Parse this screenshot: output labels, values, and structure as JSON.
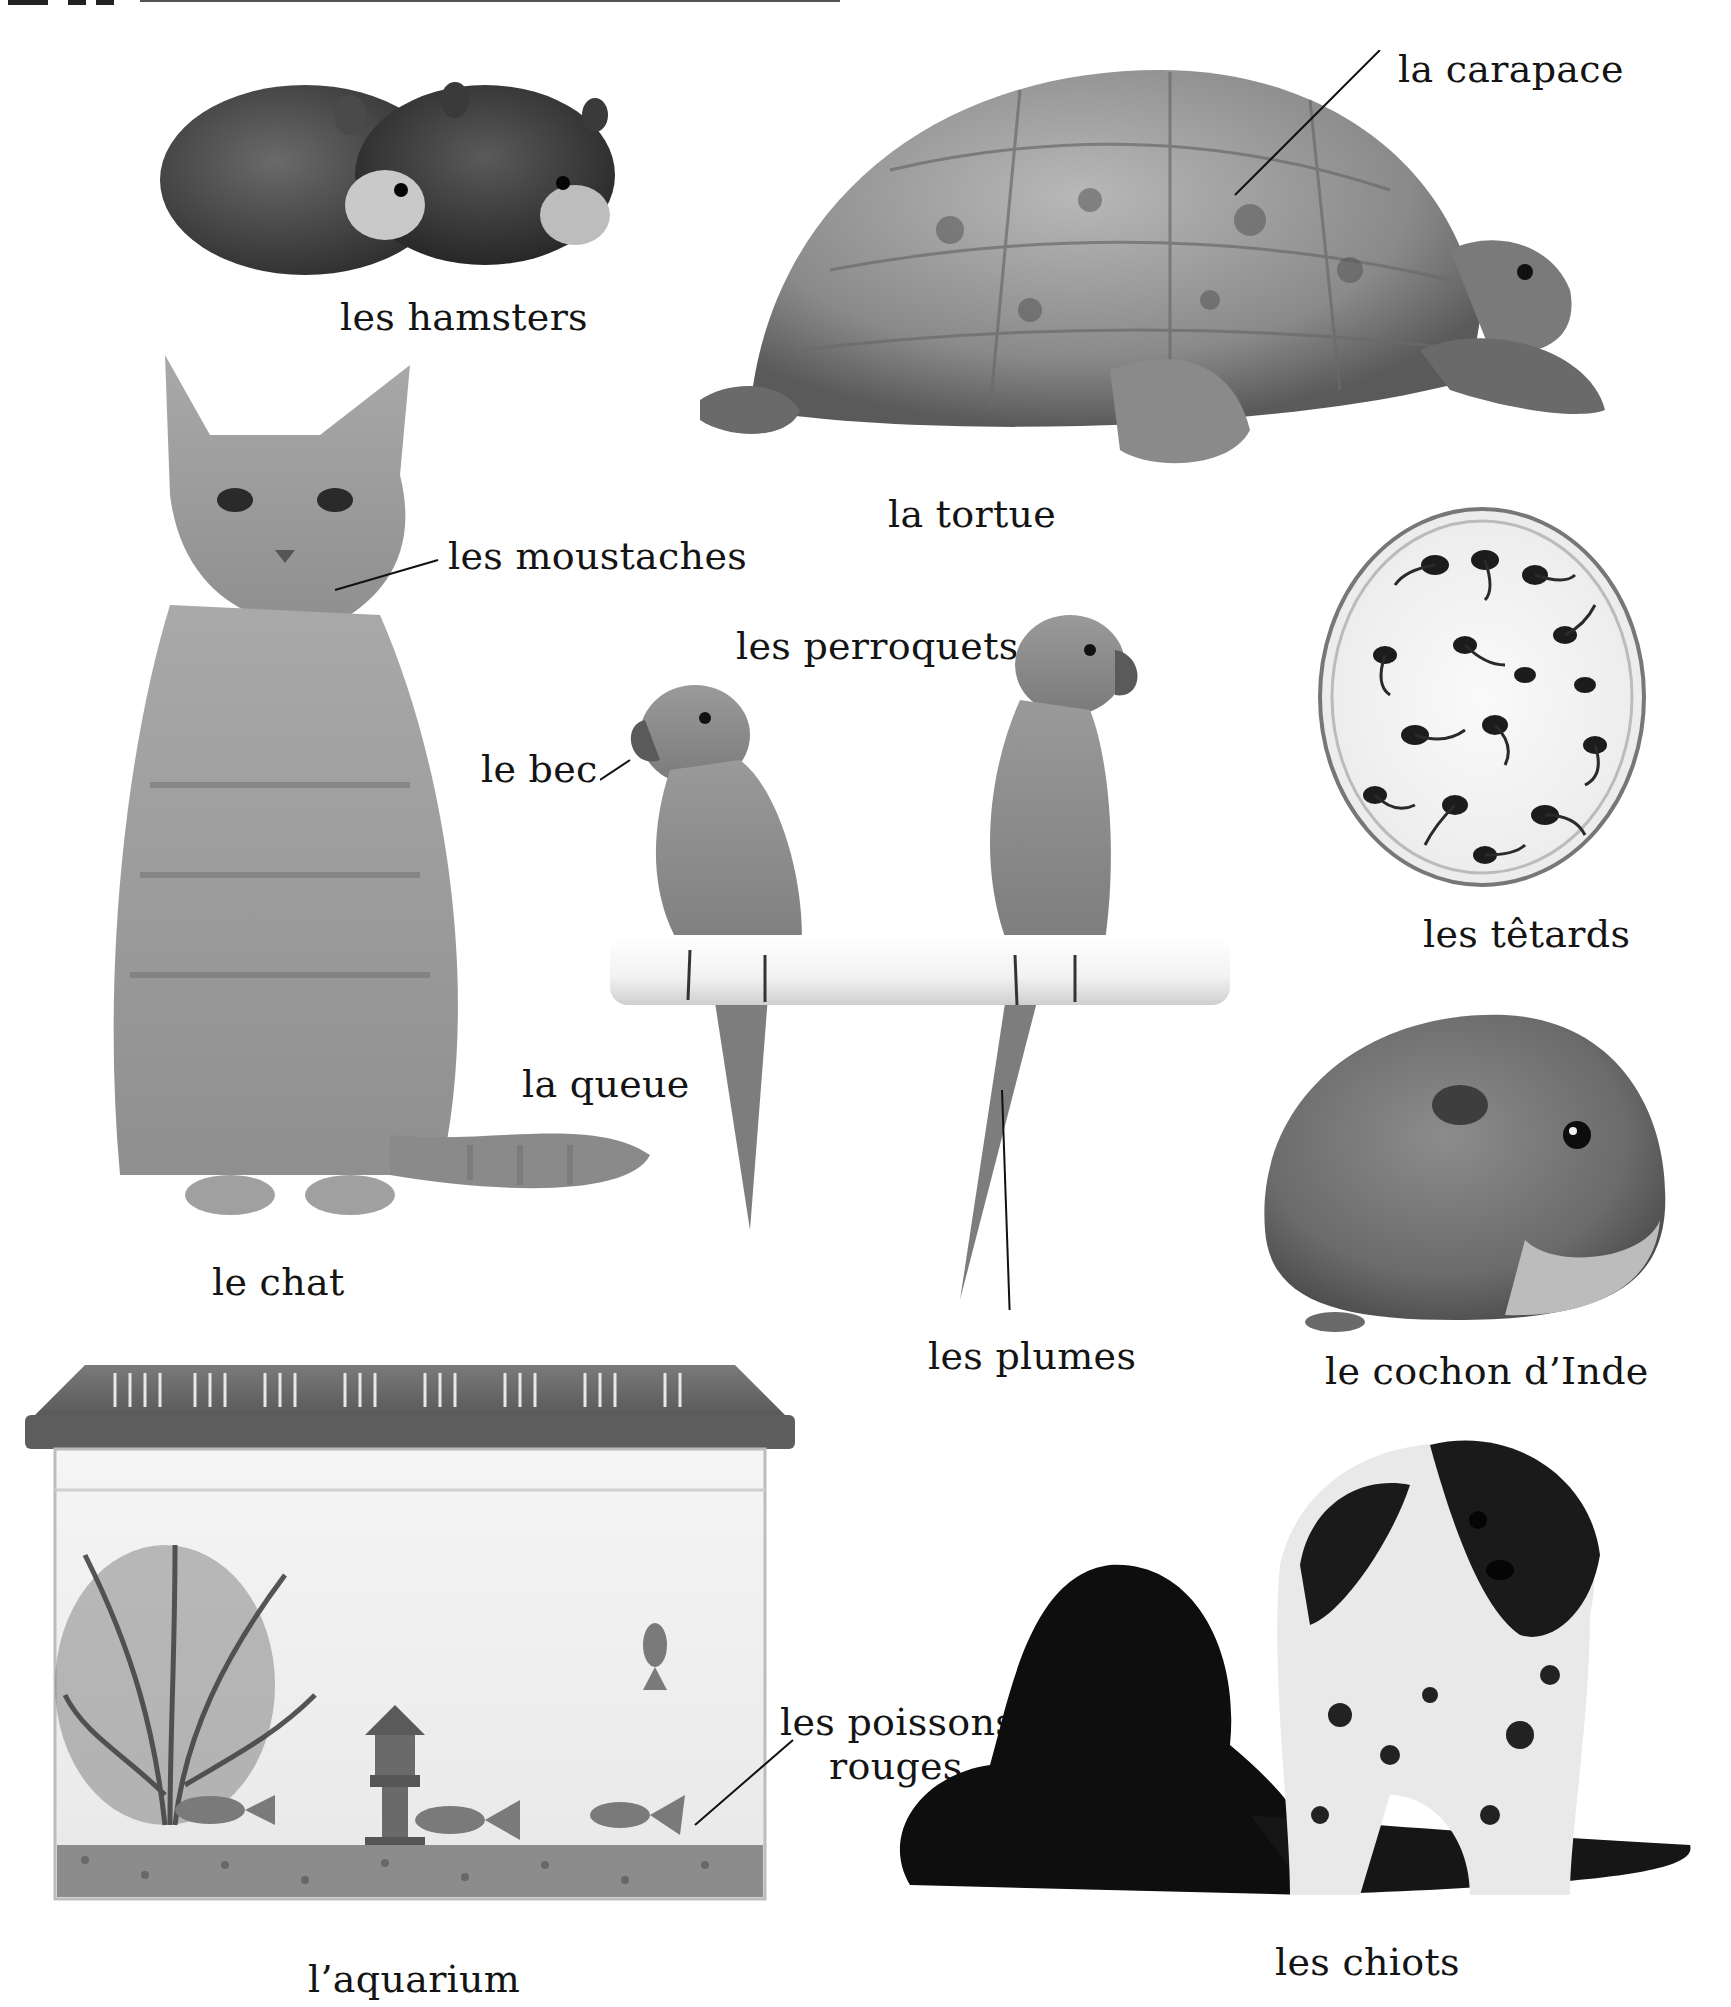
{
  "page": {
    "background": "#ffffff",
    "text_color": "#141414",
    "top_strip_note": "cropped heading strokes visible at top edge"
  },
  "items": [
    {
      "id": "hamsters",
      "label": "les hamsters"
    },
    {
      "id": "tortoise",
      "label": "la tortue",
      "parts": [
        {
          "label": "la carapace"
        }
      ]
    },
    {
      "id": "cat",
      "label": "le chat",
      "parts": [
        {
          "label": "les moustaches"
        },
        {
          "label": "la queue"
        }
      ]
    },
    {
      "id": "parrots",
      "label": "les perroquets",
      "parts": [
        {
          "label": "le bec"
        },
        {
          "label": "les plumes"
        }
      ]
    },
    {
      "id": "tadpoles",
      "label": "les têtards"
    },
    {
      "id": "guinea-pig",
      "label": "le cochon d’Inde"
    },
    {
      "id": "aquarium",
      "label": "l’aquarium",
      "parts": [
        {
          "label": "les poissons",
          "label2": "rouges"
        }
      ]
    },
    {
      "id": "puppies",
      "label": "les chiots"
    }
  ],
  "icons": {
    "hamsters": "hamster-photo",
    "tortoise": "tortoise-photo",
    "cat": "cat-photo",
    "parrots": "parrot-photo",
    "tadpoles": "petri-dish-tadpoles-photo",
    "guinea_pig": "guinea-pig-photo",
    "aquarium": "aquarium-photo",
    "puppies": "puppies-photo"
  }
}
